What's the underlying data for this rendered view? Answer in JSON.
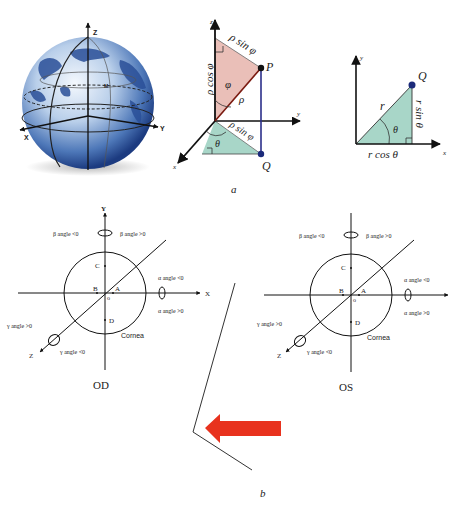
{
  "panel_a": {
    "caption": "a",
    "globe": {
      "axis_z": "Z",
      "axis_x": "X",
      "axis_y": "Y",
      "point": "M"
    },
    "spherical": {
      "axis_z": "z",
      "axis_y": "y",
      "axis_x": "x",
      "label_rho_sin_phi_top": "ρ sin φ",
      "label_rho_cos_phi": "ρ cos φ",
      "label_phi": "φ",
      "label_rho": "ρ",
      "label_P": "P",
      "label_rho_sin_phi_bottom": "ρ sin φ",
      "label_theta": "θ",
      "label_Q": "Q"
    },
    "polar": {
      "axis_y": "y",
      "axis_x": "x",
      "label_Q": "Q",
      "label_r": "r",
      "label_theta": "θ",
      "label_r_sin_theta": "r sin θ",
      "label_r_cos_theta": "r cos θ"
    }
  },
  "panel_b": {
    "caption": "b",
    "od": {
      "title": "OD",
      "axis_y": "Y",
      "axis_x": "X",
      "axis_z": "Z",
      "origin": "o",
      "points": [
        "A",
        "B",
        "C",
        "D"
      ],
      "cornea": "Cornea",
      "beta_neg": "β angle <0",
      "beta_pos": "β angle >0",
      "alpha_neg": "α angle <0",
      "alpha_pos": "α angle >0",
      "gamma_pos": "γ angle >0",
      "gamma_neg": "γ angle <0"
    },
    "os": {
      "title": "OS",
      "axis_y": "Y",
      "axis_z": "Z",
      "origin": "o",
      "points": [
        "A",
        "B",
        "C",
        "D"
      ],
      "cornea": "Cornea",
      "beta_neg": "β angle <0",
      "beta_pos": "β angle >0",
      "alpha_neg": "α angle <0",
      "alpha_pos": "α angle >0",
      "gamma_pos": "γ angle >0",
      "gamma_neg": "γ angle <0"
    },
    "arrow_color": "#e8321e"
  },
  "colors": {
    "pink_triangle": "#e8b8b0",
    "teal_triangle": "#9fd1c2",
    "blue_line": "#2b2f8a",
    "point_dot": "#1b2a7a",
    "globe_dark": "#1e3f8a",
    "globe_light": "#dfe9f6"
  }
}
